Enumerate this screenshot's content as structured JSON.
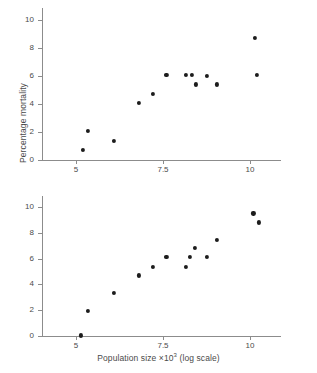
{
  "chart_data": [
    {
      "type": "scatter",
      "panel": "top",
      "title": "",
      "xlabel": "Population size ×10³ (log scale)",
      "ylabel": "Percentage mortality",
      "xlim": [
        4.45,
        10.9
      ],
      "ylim": [
        -0.55,
        10.85
      ],
      "xticks": [
        5,
        7.5,
        10
      ],
      "xticklabels": [
        "5",
        "7.5",
        "10"
      ],
      "yticks": [
        0,
        2,
        4,
        6,
        8,
        10
      ],
      "yticklabels": [
        "0",
        "2",
        "4",
        "6",
        "8",
        "10"
      ],
      "grid": false,
      "legend": null,
      "marker": "filled-circle",
      "marker_color": "#1c1c1c",
      "points": [
        {
          "x": 5.2,
          "y": 0.7
        },
        {
          "x": 5.35,
          "y": 2.05
        },
        {
          "x": 6.1,
          "y": 1.35
        },
        {
          "x": 6.8,
          "y": 4.05
        },
        {
          "x": 7.2,
          "y": 4.75
        },
        {
          "x": 7.6,
          "y": 6.05
        },
        {
          "x": 8.15,
          "y": 6.05
        },
        {
          "x": 8.32,
          "y": 6.05
        },
        {
          "x": 8.45,
          "y": 5.4
        },
        {
          "x": 8.75,
          "y": 6.0
        },
        {
          "x": 9.05,
          "y": 5.4
        },
        {
          "x": 10.15,
          "y": 8.75
        },
        {
          "x": 10.2,
          "y": 6.05
        }
      ]
    },
    {
      "type": "scatter",
      "panel": "bottom",
      "title": "",
      "xlabel": "Population size ×10³ (log scale)",
      "ylabel": "Percentage mortality",
      "xlim": [
        4.45,
        10.9
      ],
      "ylim": [
        -0.55,
        10.85
      ],
      "xticks": [
        5,
        7.5,
        10
      ],
      "xticklabels": [
        "5",
        "7.5",
        "10"
      ],
      "yticks": [
        0,
        2,
        4,
        6,
        8,
        10
      ],
      "yticklabels": [
        "0",
        "2",
        "4",
        "6",
        "8",
        "10"
      ],
      "grid": false,
      "legend": null,
      "marker": "filled-circle",
      "marker_color": "#1c1c1c",
      "points": [
        {
          "x": 5.15,
          "y": 0.05
        },
        {
          "x": 5.35,
          "y": 1.95
        },
        {
          "x": 6.1,
          "y": 3.35
        },
        {
          "x": 6.8,
          "y": 4.7
        },
        {
          "x": 7.2,
          "y": 5.35
        },
        {
          "x": 7.6,
          "y": 6.1
        },
        {
          "x": 8.15,
          "y": 5.35
        },
        {
          "x": 8.28,
          "y": 6.1
        },
        {
          "x": 8.42,
          "y": 6.8
        },
        {
          "x": 8.75,
          "y": 6.1
        },
        {
          "x": 9.05,
          "y": 7.45
        },
        {
          "x": 10.1,
          "y": 9.5
        },
        {
          "x": 10.25,
          "y": 8.8
        }
      ]
    }
  ],
  "axis_labels": {
    "y": "Percentage mortality",
    "x_prefix": "Population size ×10",
    "x_exponent": "3",
    "x_suffix": " (log scale)"
  }
}
